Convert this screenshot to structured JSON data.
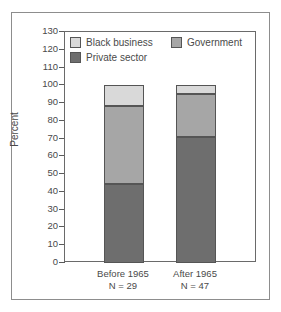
{
  "figure": {
    "ylabel": "Percent"
  },
  "legend": {
    "items": [
      {
        "label": "Black business",
        "color": "#d9d9d9",
        "key": "black_business"
      },
      {
        "label": "Government",
        "color": "#a6a6a6",
        "key": "government"
      },
      {
        "label": "Private sector",
        "color": "#6e6e6e",
        "key": "private_sector"
      }
    ]
  },
  "axis": {
    "yticks": [
      130,
      120,
      110,
      100,
      90,
      80,
      70,
      60,
      50,
      40,
      30,
      20,
      10,
      0
    ]
  },
  "xlabels": [
    {
      "line1": "Before 1965",
      "line2": "N = 29"
    },
    {
      "line1": "After 1965",
      "line2": "N = 47"
    }
  ],
  "chart_data": {
    "type": "bar",
    "subtype": "stacked",
    "title": "",
    "xlabel": "",
    "ylabel": "Percent",
    "ylim": [
      0,
      130
    ],
    "ytick_step": 10,
    "grid": false,
    "legend_position": "inside-top-left",
    "categories": [
      "Before 1965",
      "After 1965"
    ],
    "category_sublabels": [
      "N = 29",
      "N = 47"
    ],
    "sample_sizes": [
      29,
      47
    ],
    "series": [
      {
        "name": "Private sector",
        "color": "#6e6e6e",
        "values": [
          44.5,
          71.0
        ]
      },
      {
        "name": "Government",
        "color": "#a6a6a6",
        "values": [
          44.0,
          24.0
        ]
      },
      {
        "name": "Black business",
        "color": "#d9d9d9",
        "values": [
          11.5,
          5.0
        ]
      }
    ],
    "totals": [
      100,
      100
    ]
  }
}
